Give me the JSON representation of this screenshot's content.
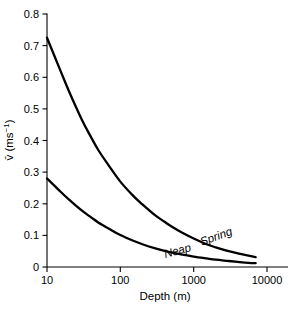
{
  "chart_data": {
    "type": "line",
    "title": "",
    "subtitle": "",
    "xlabel": "Depth (m)",
    "ylabel": "v̄ (ms⁻¹)",
    "xscale": "log",
    "yscale": "linear",
    "xlim": [
      10,
      10000
    ],
    "ylim": [
      0,
      0.8
    ],
    "grid": false,
    "legend_position": "inline-curve-labels",
    "xticks": [
      10,
      100,
      1000,
      10000
    ],
    "xtick_labels": [
      "10",
      "100",
      "1000",
      "10000"
    ],
    "yticks": [
      0,
      0.1,
      0.2,
      0.3,
      0.4,
      0.5,
      0.6,
      0.7,
      0.8
    ],
    "ytick_labels": [
      "0",
      "0.1",
      "0.2",
      "0.3",
      "0.4",
      "0.5",
      "0.6",
      "0.7",
      "0.8"
    ],
    "x": [
      10,
      15,
      20,
      30,
      40,
      50,
      70,
      100,
      150,
      200,
      300,
      400,
      500,
      700,
      1000,
      1500,
      2000,
      3000,
      4000,
      5000,
      7000
    ],
    "series": [
      {
        "name": "Spring",
        "label": "Spring",
        "color": "#000000",
        "values": [
          0.725,
          0.625,
          0.555,
          0.465,
          0.41,
          0.37,
          0.32,
          0.27,
          0.225,
          0.198,
          0.163,
          0.143,
          0.128,
          0.108,
          0.09,
          0.072,
          0.062,
          0.05,
          0.043,
          0.038,
          0.031
        ]
      },
      {
        "name": "Neap",
        "label": "Neap",
        "color": "#000000",
        "values": [
          0.28,
          0.24,
          0.213,
          0.178,
          0.157,
          0.141,
          0.121,
          0.101,
          0.083,
          0.072,
          0.059,
          0.051,
          0.046,
          0.039,
          0.033,
          0.027,
          0.023,
          0.019,
          0.016,
          0.014,
          0.012
        ]
      }
    ],
    "annotations": [
      {
        "text": "Spring",
        "x": 2100,
        "y": 0.085,
        "rotation": -20,
        "style": "italic"
      },
      {
        "text": "Neap",
        "x": 620,
        "y": 0.04,
        "rotation": -15,
        "style": "italic"
      }
    ]
  }
}
